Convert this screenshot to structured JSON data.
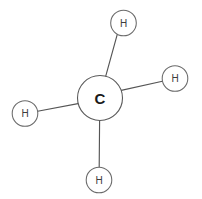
{
  "diagram": {
    "type": "molecule-structure",
    "background_color": "#ffffff",
    "bond_color": "#555555",
    "atom_outline_color": "#5a5a5a",
    "central_atom": {
      "symbol": "C",
      "name": "carbon",
      "cx": 100,
      "cy": 98,
      "r": 22.5
    },
    "atoms": [
      {
        "id": "h-top",
        "symbol": "H",
        "name": "hydrogen-top",
        "cx": 123.5,
        "cy": 23,
        "r": 12.8
      },
      {
        "id": "h-right",
        "symbol": "H",
        "name": "hydrogen-right",
        "cx": 175,
        "cy": 78.5,
        "r": 12.8
      },
      {
        "id": "h-left",
        "symbol": "H",
        "name": "hydrogen-left",
        "cx": 25,
        "cy": 113.5,
        "r": 12.8
      },
      {
        "id": "h-bottom",
        "symbol": "H",
        "name": "hydrogen-bottom",
        "cx": 99,
        "cy": 180,
        "r": 12.8
      }
    ],
    "bonds": [
      {
        "id": "bond-c-h-top",
        "from": "C",
        "to": "H",
        "x1": 117.2,
        "y1": 34.6,
        "x2": 105.6,
        "y2": 76.6
      },
      {
        "id": "bond-c-h-right",
        "from": "C",
        "to": "H",
        "x1": 162.4,
        "y1": 81.2,
        "x2": 121.2,
        "y2": 90.4
      },
      {
        "id": "bond-c-h-left",
        "from": "C",
        "to": "H",
        "x1": 37.6,
        "y1": 111.3,
        "x2": 78.0,
        "y2": 103.6
      },
      {
        "id": "bond-c-h-bottom",
        "from": "C",
        "to": "H",
        "x1": 99.2,
        "y1": 167.2,
        "x2": 99.6,
        "y2": 120.4
      }
    ]
  }
}
